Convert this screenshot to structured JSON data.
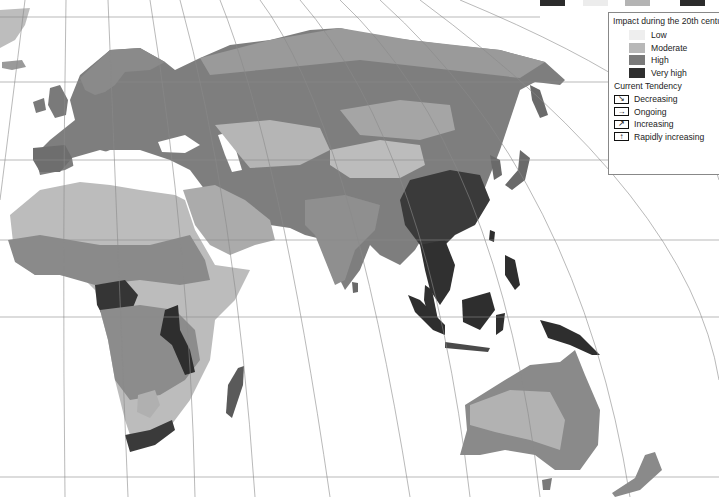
{
  "map": {
    "title_visible": false,
    "regions_shown": [
      "Europe",
      "Asia",
      "Africa",
      "Middle East",
      "Southeast Asia",
      "Australia",
      "New Zealand",
      "Japan",
      "Madagascar"
    ],
    "projection": "curved graticule (meridians converging north)"
  },
  "top_legend_fragment": {
    "swatches": [
      {
        "color": "#2b2b2b",
        "symbol": "↑"
      },
      {
        "color": "#ececec",
        "symbol": "↑"
      },
      {
        "color": "#b4b4b4",
        "symbol": "↗"
      },
      {
        "color": "#2b2b2b",
        "symbol": "↑"
      }
    ]
  },
  "legend": {
    "impact_title": "Impact during the 20th century",
    "impact_levels": [
      {
        "label": "Low",
        "color": "#eeeeee"
      },
      {
        "label": "Moderate",
        "color": "#b8b8b8"
      },
      {
        "label": "High",
        "color": "#7a7a7a"
      },
      {
        "label": "Very high",
        "color": "#2e2e2e"
      }
    ],
    "tendency_title": "Current Tendency",
    "tendencies": [
      {
        "label": "Decreasing",
        "icon": "arrow-down-right",
        "glyph": "↘"
      },
      {
        "label": "Ongoing",
        "icon": "arrow-right",
        "glyph": "→"
      },
      {
        "label": "Increasing",
        "icon": "arrow-up-right",
        "glyph": "↗"
      },
      {
        "label": "Rapidly increasing",
        "icon": "arrow-up",
        "glyph": "↑"
      }
    ]
  },
  "colors": {
    "ocean": "#ffffff",
    "graticule": "#8a8a8a",
    "low": "#eeeeee",
    "moderate": "#b8b8b8",
    "high": "#7a7a7a",
    "very_high": "#2e2e2e"
  }
}
